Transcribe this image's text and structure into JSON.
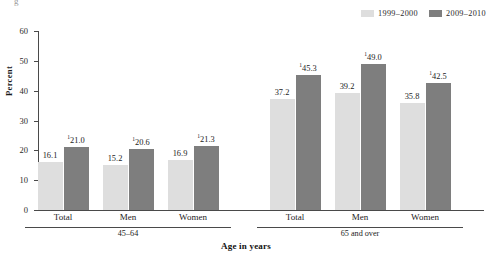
{
  "top_clip_glyph": "g",
  "legend": {
    "position": "top-right",
    "items": [
      {
        "label": "1999–2000",
        "color": "#dedede",
        "swatch_name": "legend-swatch-1999-2000"
      },
      {
        "label": "2009–2010",
        "color": "#7e7e7e",
        "swatch_name": "legend-swatch-2009-2010"
      }
    ]
  },
  "axis": {
    "ylabel": "Percent",
    "xlabel": "Age in years",
    "yticks": [
      0,
      10,
      20,
      30,
      40,
      50,
      60
    ],
    "ytick_labels": [
      "0",
      "10",
      "20",
      "30",
      "40",
      "50",
      "60"
    ]
  },
  "groups": [
    {
      "label": "45–64",
      "categories": [
        "Total",
        "Men",
        "Women"
      ]
    },
    {
      "label": "65 and over",
      "categories": [
        "Total",
        "Men",
        "Women"
      ]
    }
  ],
  "bars": [
    {
      "group": "45–64",
      "category": "Total",
      "series": "1999–2000",
      "value": 16.1,
      "label": "16.1",
      "footnote": "",
      "color": "#dedede"
    },
    {
      "group": "45–64",
      "category": "Total",
      "series": "2009–2010",
      "value": 21.0,
      "label": "21.0",
      "footnote": "1",
      "color": "#7e7e7e"
    },
    {
      "group": "45–64",
      "category": "Men",
      "series": "1999–2000",
      "value": 15.2,
      "label": "15.2",
      "footnote": "",
      "color": "#dedede"
    },
    {
      "group": "45–64",
      "category": "Men",
      "series": "2009–2010",
      "value": 20.6,
      "label": "20.6",
      "footnote": "1",
      "color": "#7e7e7e"
    },
    {
      "group": "45–64",
      "category": "Women",
      "series": "1999–2000",
      "value": 16.9,
      "label": "16.9",
      "footnote": "",
      "color": "#dedede"
    },
    {
      "group": "45–64",
      "category": "Women",
      "series": "2009–2010",
      "value": 21.3,
      "label": "21.3",
      "footnote": "1",
      "color": "#7e7e7e"
    },
    {
      "group": "65 and over",
      "category": "Total",
      "series": "1999–2000",
      "value": 37.2,
      "label": "37.2",
      "footnote": "",
      "color": "#dedede"
    },
    {
      "group": "65 and over",
      "category": "Total",
      "series": "2009–2010",
      "value": 45.3,
      "label": "45.3",
      "footnote": "1",
      "color": "#7e7e7e"
    },
    {
      "group": "65 and over",
      "category": "Men",
      "series": "1999–2000",
      "value": 39.2,
      "label": "39.2",
      "footnote": "",
      "color": "#dedede"
    },
    {
      "group": "65 and over",
      "category": "Men",
      "series": "2009–2010",
      "value": 49.0,
      "label": "49.0",
      "footnote": "1",
      "color": "#7e7e7e"
    },
    {
      "group": "65 and over",
      "category": "Women",
      "series": "1999–2000",
      "value": 35.8,
      "label": "35.8",
      "footnote": "",
      "color": "#dedede"
    },
    {
      "group": "65 and over",
      "category": "Women",
      "series": "2009–2010",
      "value": 42.5,
      "label": "42.5",
      "footnote": "1",
      "color": "#7e7e7e"
    }
  ],
  "chart_data": {
    "type": "bar",
    "title": "",
    "subtitle": "",
    "xlabel": "Age in years",
    "ylabel": "Percent",
    "ylim": [
      0,
      60
    ],
    "ytick_step": 10,
    "grid": false,
    "legend_position": "top-right",
    "group_labels": [
      "45–64",
      "65 and over"
    ],
    "categories": [
      "Total",
      "Men",
      "Women",
      "Total",
      "Men",
      "Women"
    ],
    "series": [
      {
        "name": "1999–2000",
        "color": "#dedede",
        "values": [
          16.1,
          15.2,
          16.9,
          37.2,
          39.2,
          35.8
        ]
      },
      {
        "name": "2009–2010",
        "color": "#7e7e7e",
        "values": [
          21.0,
          20.6,
          21.3,
          45.3,
          49.0,
          42.5
        ]
      }
    ],
    "data_labels": [
      [
        "16.1",
        "15.2",
        "16.9",
        "37.2",
        "39.2",
        "35.8"
      ],
      [
        "¹21.0",
        "¹20.6",
        "¹21.3",
        "¹45.3",
        "¹49.0",
        "¹42.5"
      ]
    ],
    "annotations": [
      "superscript 1 marks 2009-2010 values"
    ]
  }
}
